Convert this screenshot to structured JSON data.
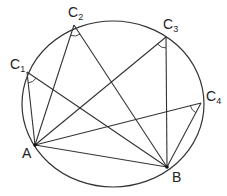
{
  "diagram": {
    "circle": {
      "cx": 113,
      "cy": 104,
      "rx": 91,
      "ry": 83
    },
    "points": {
      "A": {
        "label": "A",
        "sub": "",
        "x": 35,
        "y": 145,
        "lx": 22,
        "ly": 158
      },
      "B": {
        "label": "B",
        "sub": "",
        "x": 167,
        "y": 167,
        "lx": 172,
        "ly": 182
      },
      "C1": {
        "label": "C",
        "sub": "1",
        "x": 27,
        "y": 72,
        "lx": 10,
        "ly": 69
      },
      "C2": {
        "label": "C",
        "sub": "2",
        "x": 74,
        "y": 25,
        "lx": 68,
        "ly": 17
      },
      "C3": {
        "label": "C",
        "sub": "3",
        "x": 166,
        "y": 37,
        "lx": 163,
        "ly": 29
      },
      "C4": {
        "label": "C",
        "sub": "4",
        "x": 201,
        "y": 103,
        "lx": 206,
        "ly": 101
      }
    },
    "chords": [
      [
        "A",
        "B"
      ],
      [
        "A",
        "C1"
      ],
      [
        "B",
        "C1"
      ],
      [
        "A",
        "C2"
      ],
      [
        "B",
        "C2"
      ],
      [
        "A",
        "C3"
      ],
      [
        "B",
        "C3"
      ],
      [
        "A",
        "C4"
      ],
      [
        "B",
        "C4"
      ]
    ],
    "angle_marks": [
      "C1",
      "C2",
      "C3",
      "C4"
    ],
    "line_color": "#333333",
    "point_color": "#111111"
  }
}
